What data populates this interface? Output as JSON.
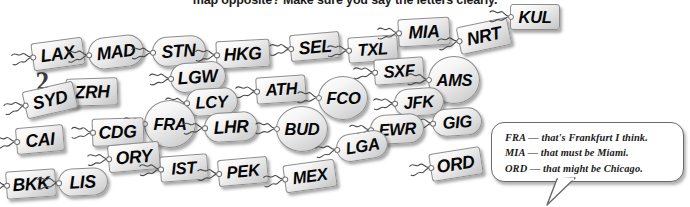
{
  "instruction": "map opposite? Make sure you say the letters clearly.",
  "page_number": "2",
  "tags": [
    {
      "code": "LAX",
      "shape": "rect",
      "x": 32,
      "y": 40,
      "w": 52,
      "h": 28,
      "rot": -8,
      "fs": 18
    },
    {
      "code": "MAD",
      "shape": "round",
      "x": 88,
      "y": 36,
      "w": 56,
      "h": 32,
      "rot": -7,
      "fs": 18
    },
    {
      "code": "STN",
      "shape": "round",
      "x": 152,
      "y": 36,
      "w": 54,
      "h": 30,
      "rot": -4,
      "fs": 18
    },
    {
      "code": "HKG",
      "shape": "rect",
      "x": 216,
      "y": 40,
      "w": 54,
      "h": 28,
      "rot": -3,
      "fs": 18
    },
    {
      "code": "SEL",
      "shape": "rect",
      "x": 290,
      "y": 33,
      "w": 50,
      "h": 27,
      "rot": -5,
      "fs": 18
    },
    {
      "code": "TXL",
      "shape": "rect",
      "x": 348,
      "y": 36,
      "w": 50,
      "h": 26,
      "rot": -4,
      "fs": 17
    },
    {
      "code": "MIA",
      "shape": "rect",
      "x": 398,
      "y": 18,
      "w": 52,
      "h": 28,
      "rot": -3,
      "fs": 18
    },
    {
      "code": "NRT",
      "shape": "rect",
      "x": 458,
      "y": 22,
      "w": 52,
      "h": 28,
      "rot": -12,
      "fs": 18
    },
    {
      "code": "KUL",
      "shape": "rect",
      "x": 510,
      "y": 4,
      "w": 50,
      "h": 26,
      "rot": 0,
      "fs": 17
    },
    {
      "code": "LGW",
      "shape": "round",
      "x": 170,
      "y": 62,
      "w": 56,
      "h": 30,
      "rot": -4,
      "fs": 18
    },
    {
      "code": "ATH",
      "shape": "rect",
      "x": 256,
      "y": 76,
      "w": 50,
      "h": 27,
      "rot": -4,
      "fs": 17
    },
    {
      "code": "FCO",
      "shape": "circle",
      "x": 318,
      "y": 76,
      "w": 50,
      "h": 44,
      "rot": 0,
      "fs": 17
    },
    {
      "code": "SXF",
      "shape": "rect",
      "x": 374,
      "y": 58,
      "w": 50,
      "h": 26,
      "rot": -4,
      "fs": 17
    },
    {
      "code": "AMS",
      "shape": "circle",
      "x": 428,
      "y": 56,
      "w": 52,
      "h": 48,
      "rot": 0,
      "fs": 17
    },
    {
      "code": "ZRH",
      "shape": "rect",
      "x": 66,
      "y": 78,
      "w": 52,
      "h": 28,
      "rot": -2,
      "fs": 18
    },
    {
      "code": "LCY",
      "shape": "round",
      "x": 186,
      "y": 88,
      "w": 52,
      "h": 28,
      "rot": -3,
      "fs": 17
    },
    {
      "code": "SYD",
      "shape": "rect",
      "x": 24,
      "y": 86,
      "w": 52,
      "h": 28,
      "rot": -13,
      "fs": 18
    },
    {
      "code": "FRA",
      "shape": "circle",
      "x": 144,
      "y": 100,
      "w": 52,
      "h": 48,
      "rot": 0,
      "fs": 17
    },
    {
      "code": "LHR",
      "shape": "round",
      "x": 204,
      "y": 112,
      "w": 54,
      "h": 30,
      "rot": -3,
      "fs": 18
    },
    {
      "code": "BUD",
      "shape": "circle",
      "x": 276,
      "y": 106,
      "w": 52,
      "h": 46,
      "rot": 0,
      "fs": 17
    },
    {
      "code": "JFK",
      "shape": "round",
      "x": 394,
      "y": 88,
      "w": 50,
      "h": 28,
      "rot": -4,
      "fs": 17
    },
    {
      "code": "GIG",
      "shape": "round",
      "x": 432,
      "y": 108,
      "w": 50,
      "h": 28,
      "rot": -4,
      "fs": 17
    },
    {
      "code": "EWR",
      "shape": "round",
      "x": 370,
      "y": 114,
      "w": 54,
      "h": 30,
      "rot": -3,
      "fs": 17
    },
    {
      "code": "CAI",
      "shape": "rect",
      "x": 16,
      "y": 126,
      "w": 48,
      "h": 27,
      "rot": -5,
      "fs": 18
    },
    {
      "code": "CDG",
      "shape": "rect",
      "x": 92,
      "y": 118,
      "w": 52,
      "h": 28,
      "rot": -2,
      "fs": 18
    },
    {
      "code": "LGA",
      "shape": "round",
      "x": 336,
      "y": 132,
      "w": 52,
      "h": 28,
      "rot": -9,
      "fs": 17
    },
    {
      "code": "ORY",
      "shape": "rect",
      "x": 108,
      "y": 143,
      "w": 52,
      "h": 28,
      "rot": -5,
      "fs": 18
    },
    {
      "code": "ORD",
      "shape": "rect",
      "x": 430,
      "y": 150,
      "w": 52,
      "h": 28,
      "rot": -9,
      "fs": 18
    },
    {
      "code": "IST",
      "shape": "rect",
      "x": 160,
      "y": 155,
      "w": 48,
      "h": 26,
      "rot": -4,
      "fs": 17
    },
    {
      "code": "PEK",
      "shape": "rect",
      "x": 218,
      "y": 158,
      "w": 50,
      "h": 27,
      "rot": -5,
      "fs": 17
    },
    {
      "code": "MEX",
      "shape": "rect",
      "x": 284,
      "y": 162,
      "w": 52,
      "h": 28,
      "rot": -8,
      "fs": 17
    },
    {
      "code": "BKK",
      "shape": "rect",
      "x": 6,
      "y": 170,
      "w": 50,
      "h": 28,
      "rot": -4,
      "fs": 18
    },
    {
      "code": "LIS",
      "shape": "round",
      "x": 58,
      "y": 168,
      "w": 50,
      "h": 28,
      "rot": -3,
      "fs": 18
    }
  ],
  "bubble": {
    "lines": [
      "FRA — that's Frankfurt I think.",
      "MIA — that must be Miami.",
      "ORD — that might be Chicago."
    ]
  }
}
